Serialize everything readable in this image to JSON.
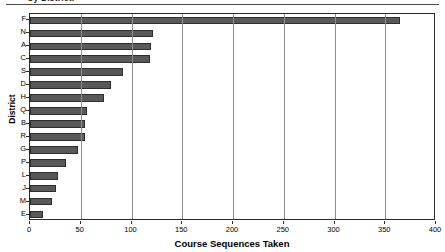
{
  "caption": {
    "text": "by District."
  },
  "chart_data": {
    "type": "bar",
    "orientation": "horizontal",
    "title": "",
    "xlabel": "Course Sequences Taken",
    "ylabel": "District",
    "categories": [
      "F",
      "N",
      "A",
      "C",
      "S",
      "D",
      "H",
      "Q",
      "B",
      "R",
      "G",
      "P",
      "L",
      "J",
      "M",
      "E"
    ],
    "values": [
      365,
      121,
      119,
      118,
      92,
      80,
      73,
      56,
      54,
      54,
      47,
      35,
      28,
      26,
      22,
      13
    ],
    "xlim": [
      0,
      400
    ],
    "xticks": [
      0,
      50,
      100,
      150,
      200,
      250,
      300,
      350,
      400
    ],
    "xtick_labels": [
      "0",
      "50",
      "100",
      "150",
      "200",
      "250",
      "300",
      "350",
      "400"
    ],
    "grid": "vertical",
    "legend": "none",
    "bar_color": "#595959",
    "bar_edge_color": "#2e2e2e",
    "axis_color": "#2b2b2b",
    "grid_color": "#8c8c8c",
    "background_color": "#ffffff"
  }
}
